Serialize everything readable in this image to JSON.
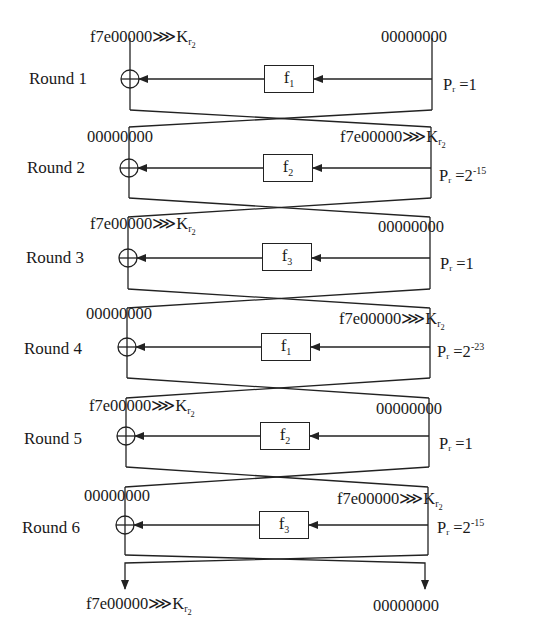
{
  "diagram": {
    "type": "feistel-differential-characteristic",
    "rounds": [
      {
        "label": "Round 1",
        "func": "f",
        "func_sub": "1",
        "prob_base": "P",
        "prob_sub": "r",
        "prob_eq": " =1",
        "prob_exp": "",
        "left_in": "f7e00000",
        "left_rot": "⋙K",
        "left_ksub": "r",
        "left_ksub2": "2",
        "right_in": "00000000"
      },
      {
        "label": "Round 2",
        "func": "f",
        "func_sub": "2",
        "prob_base": "P",
        "prob_sub": "r",
        "prob_eq": " =2",
        "prob_exp": "-15",
        "left_in": "00000000",
        "right_in": "f7e00000",
        "right_rot": "⋙K",
        "right_ksub": "r",
        "right_ksub2": "2"
      },
      {
        "label": "Round 3",
        "func": "f",
        "func_sub": "3",
        "prob_base": "P",
        "prob_sub": "r",
        "prob_eq": " =1",
        "prob_exp": "",
        "left_in": "f7e00000",
        "left_rot": "⋙K",
        "left_ksub": "r",
        "left_ksub2": "2",
        "right_in": "00000000"
      },
      {
        "label": "Round 4",
        "func": "f",
        "func_sub": "1",
        "prob_base": "P",
        "prob_sub": "r",
        "prob_eq": " =2",
        "prob_exp": "-23",
        "left_in": "00000000",
        "right_in": "f7e00000",
        "right_rot": "⋙K",
        "right_ksub": "r",
        "right_ksub2": "2"
      },
      {
        "label": "Round 5",
        "func": "f",
        "func_sub": "2",
        "prob_base": "P",
        "prob_sub": "r",
        "prob_eq": " =1",
        "prob_exp": "",
        "left_in": "f7e00000",
        "left_rot": "⋙K",
        "left_ksub": "r",
        "left_ksub2": "2",
        "right_in": "00000000"
      },
      {
        "label": "Round 6",
        "func": "f",
        "func_sub": "3",
        "prob_base": "P",
        "prob_sub": "r",
        "prob_eq": " =2",
        "prob_exp": "-15",
        "left_in": "00000000",
        "right_in": "f7e00000",
        "right_rot": "⋙K",
        "right_ksub": "r",
        "right_ksub2": "2"
      }
    ],
    "output": {
      "left": "f7e00000",
      "left_rot": "⋙K",
      "left_ksub": "r",
      "left_ksub2": "2",
      "right": "00000000"
    },
    "colors": {
      "line": "#222222",
      "text": "#1a1a1a",
      "background": "#ffffff"
    }
  }
}
